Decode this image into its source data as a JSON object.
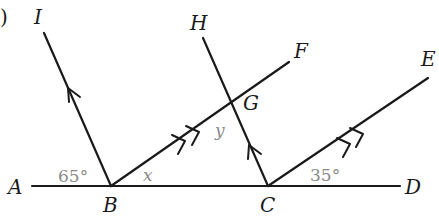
{
  "figure": {
    "prefix": ")",
    "points": {
      "A": "A",
      "B": "B",
      "C": "C",
      "D": "D",
      "E": "E",
      "F": "F",
      "G": "G",
      "H": "H",
      "I": "I"
    },
    "angles": {
      "ABI": "65°",
      "DCE": "35°"
    },
    "variables": {
      "x": "x",
      "y": "y"
    },
    "parallel_marks": {
      "single": [
        "BI",
        "CH"
      ],
      "double": [
        "BF",
        "CE"
      ]
    }
  }
}
